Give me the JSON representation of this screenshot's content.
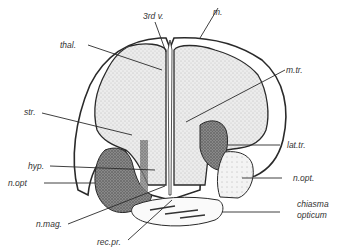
{
  "figure": {
    "labels": {
      "third_ventricle": "3rd v.",
      "m": "m.",
      "thal": "thal.",
      "m_tr": "m.tr.",
      "str": "str.",
      "lat_tr": "lat.tr.",
      "hyp": "hyp.",
      "n_opt_left": "n.opt",
      "n_opt_right": "n.opt.",
      "n_mag": "n.mag.",
      "chiasma_line1": "chiasma",
      "chiasma_line2": "opticum",
      "rec_pr": "rec.pr."
    },
    "colors": {
      "ink": "#2a2a2a",
      "stipple_light": "#d9d9d9",
      "stipple_dark": "#6e6e6e",
      "background": "#ffffff"
    }
  }
}
